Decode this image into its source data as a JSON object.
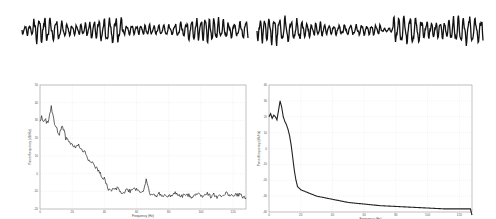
{
  "chart_data": [
    {
      "type": "line",
      "title": "",
      "panel": "top-left",
      "description": "EEG time-series waveform segment (no axes)",
      "xlabel": "",
      "ylabel": "",
      "axes_visible": false
    },
    {
      "type": "line",
      "title": "",
      "panel": "top-right",
      "description": "EEG time-series waveform segment (no axes)",
      "xlabel": "",
      "ylabel": "",
      "axes_visible": false
    },
    {
      "type": "line",
      "title": "",
      "panel": "bottom-left",
      "xlabel": "Frequency (Hz)",
      "ylabel": "Power/frequency (dB/Hz)",
      "xlim": [
        0,
        128
      ],
      "xticks": [
        0,
        20,
        40,
        60,
        80,
        100,
        120
      ],
      "ylim": [
        -20,
        50
      ],
      "yticks": [
        -20,
        -10,
        0,
        10,
        20,
        30,
        40,
        50
      ],
      "grid": true,
      "x": [
        0,
        1,
        2,
        3,
        4,
        5,
        6,
        7,
        8,
        9,
        10,
        11,
        12,
        13,
        14,
        15,
        16,
        18,
        20,
        22,
        24,
        26,
        28,
        30,
        32,
        34,
        36,
        38,
        40,
        42,
        44,
        46,
        48,
        50,
        52,
        54,
        56,
        58,
        60,
        62,
        64,
        66,
        68,
        70,
        72,
        74,
        76,
        78,
        80,
        82,
        84,
        86,
        88,
        90,
        92,
        94,
        96,
        98,
        100,
        102,
        104,
        106,
        108,
        110,
        112,
        114,
        116,
        118,
        120,
        122,
        124,
        126,
        128
      ],
      "y": [
        30,
        32,
        30,
        31,
        29,
        28,
        33,
        38,
        33,
        28,
        26,
        24,
        22,
        25,
        27,
        24,
        20,
        18,
        16,
        15,
        16,
        13,
        12,
        8,
        7,
        4,
        2,
        -1,
        -3,
        -8,
        -10,
        -9,
        -8,
        -10,
        -11,
        -9,
        -10,
        -8,
        -9,
        -10,
        -10,
        -4,
        -11,
        -12,
        -13,
        -11,
        -12,
        -13,
        -12,
        -13,
        -11,
        -12,
        -13,
        -12,
        -12,
        -13,
        -12,
        -11,
        -13,
        -12,
        -11,
        -13,
        -12,
        -13,
        -12,
        -13,
        -11,
        -12,
        -13,
        -12,
        -12,
        -13,
        -14
      ]
    },
    {
      "type": "line",
      "title": "",
      "panel": "bottom-right",
      "xlabel": "Frequency (Hz)",
      "ylabel": "Power/frequency (dB/Hz)",
      "xlim": [
        0,
        128
      ],
      "xticks": [
        0,
        20,
        40,
        60,
        80,
        100,
        120
      ],
      "ylim": [
        -40,
        40
      ],
      "yticks": [
        -40,
        -30,
        -20,
        -10,
        0,
        10,
        20,
        30,
        40
      ],
      "grid": true,
      "x": [
        0,
        1,
        2,
        3,
        4,
        5,
        6,
        7,
        8,
        9,
        10,
        11,
        12,
        13,
        14,
        15,
        16,
        17,
        18,
        19,
        20,
        25,
        30,
        40,
        50,
        60,
        70,
        80,
        90,
        100,
        110,
        120,
        127,
        128
      ],
      "y": [
        20,
        22,
        19,
        21,
        20,
        18,
        24,
        30,
        26,
        20,
        17,
        15,
        12,
        8,
        2,
        -6,
        -14,
        -20,
        -24,
        -25,
        -26,
        -28,
        -30,
        -32,
        -34,
        -35,
        -36,
        -36.5,
        -37,
        -37.5,
        -38,
        -38,
        -38,
        -42
      ]
    }
  ]
}
